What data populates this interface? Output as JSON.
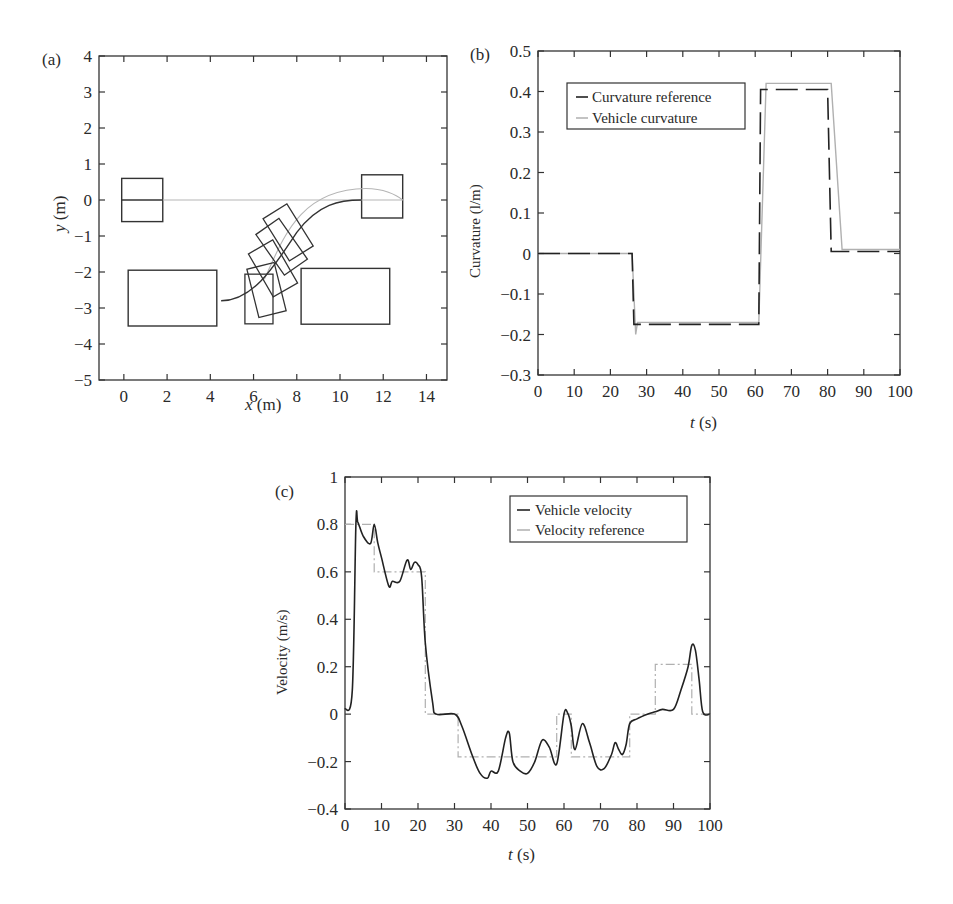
{
  "panels": {
    "a": {
      "label": "(a)",
      "xlabel_var": "x",
      "xlabel_unit": " (m)",
      "ylabel_var": "y",
      "ylabel_unit": " (m)"
    },
    "b": {
      "label": "(b)",
      "xlabel_var": "t",
      "xlabel_unit": " (s)",
      "ylabel": "Curvature (l/m)",
      "legend": [
        "Curvature reference",
        "Vehicle curvature"
      ]
    },
    "c": {
      "label": "(c)",
      "xlabel_var": "t",
      "xlabel_unit": " (s)",
      "ylabel": "Velocity (m/s)",
      "legend": [
        "Vehicle velocity",
        "Velocity reference"
      ]
    }
  },
  "chart_data": [
    {
      "type": "line",
      "panel": "(a)",
      "title": "",
      "xlabel": "x (m)",
      "ylabel": "y (m)",
      "xlim": [
        -1,
        15
      ],
      "ylim": [
        -5,
        4
      ],
      "xticks": [
        0,
        2,
        4,
        6,
        8,
        10,
        12,
        14
      ],
      "yticks": [
        4,
        3,
        2,
        1,
        0,
        -1,
        -2,
        -3,
        -4,
        -5
      ],
      "series": [
        {
          "name": "reference path",
          "color": "#aaaaaa",
          "x": [
            0,
            8,
            10,
            11,
            12,
            13
          ],
          "y": [
            0,
            0,
            0.2,
            0.3,
            0.25,
            0
          ]
        },
        {
          "name": "vehicle path",
          "color": "#222222",
          "x": [
            0,
            1.8
          ],
          "y": [
            0,
            0
          ]
        },
        {
          "name": "vehicle path (parking)",
          "color": "#222222",
          "x": [
            4.5,
            5.5,
            6.5,
            7.5,
            8.5,
            9.5,
            10.5,
            11
          ],
          "y": [
            -2.8,
            -2.6,
            -2.1,
            -1.4,
            -0.7,
            -0.25,
            0,
            0
          ]
        }
      ],
      "obstacles": [
        {
          "name": "start box",
          "x0": -0.1,
          "y0": -0.6,
          "x1": 1.8,
          "y1": 0.6
        },
        {
          "name": "goal box",
          "x0": 11,
          "y0": -0.5,
          "x1": 12.9,
          "y1": 0.7
        },
        {
          "name": "parked car left",
          "x0": 0.2,
          "y0": -3.5,
          "x1": 4.3,
          "y1": -1.95
        },
        {
          "name": "parked car right",
          "x0": 8.2,
          "y0": -3.45,
          "x1": 12.3,
          "y1": -1.9
        }
      ]
    },
    {
      "type": "line",
      "panel": "(b)",
      "title": "",
      "xlabel": "t (s)",
      "ylabel": "Curvature (l/m)",
      "xlim": [
        0,
        100
      ],
      "ylim": [
        -0.3,
        0.5
      ],
      "xticks": [
        0,
        10,
        20,
        30,
        40,
        50,
        60,
        70,
        80,
        90,
        100
      ],
      "yticks": [
        0.5,
        0.4,
        0.3,
        0.2,
        0.1,
        0,
        -0.1,
        -0.2,
        -0.3
      ],
      "legend_position": "upper left",
      "series": [
        {
          "name": "Curvature reference",
          "style": "dashed",
          "color": "#222222",
          "x": [
            0,
            26,
            26.5,
            61,
            61.5,
            80,
            81,
            100
          ],
          "y": [
            0,
            0,
            -0.175,
            -0.175,
            0.405,
            0.405,
            0.005,
            0.005
          ]
        },
        {
          "name": "Vehicle curvature",
          "style": "solid",
          "color": "#aaaaaa",
          "x": [
            0,
            26,
            27,
            27.5,
            61,
            63,
            81,
            84,
            100
          ],
          "y": [
            0,
            0,
            -0.2,
            -0.17,
            -0.17,
            0.42,
            0.42,
            0.01,
            0.01
          ]
        }
      ]
    },
    {
      "type": "line",
      "panel": "(c)",
      "title": "",
      "xlabel": "t (s)",
      "ylabel": "Velocity (m/s)",
      "xlim": [
        0,
        100
      ],
      "ylim": [
        -0.4,
        1
      ],
      "xticks": [
        0,
        10,
        20,
        30,
        40,
        50,
        60,
        70,
        80,
        90,
        100
      ],
      "yticks": [
        1,
        0.8,
        0.6,
        0.4,
        0.2,
        0,
        -0.2,
        -0.4
      ],
      "legend_position": "upper right",
      "series": [
        {
          "name": "Vehicle velocity",
          "style": "solid",
          "color": "#222222",
          "x": [
            0,
            2,
            3,
            3.5,
            5,
            7,
            8,
            9,
            10,
            12,
            13,
            15,
            17,
            18,
            19,
            20,
            21,
            22,
            24,
            25,
            30,
            32,
            35,
            37,
            39,
            40,
            42,
            44,
            45,
            46,
            48,
            50,
            52,
            54,
            56,
            58,
            60,
            61,
            62,
            63,
            65,
            67,
            69,
            71,
            73,
            74,
            75,
            76,
            77,
            78,
            80,
            83,
            85,
            87,
            90,
            92,
            94,
            95,
            96,
            97,
            98,
            100
          ],
          "y": [
            0.02,
            0.1,
            0.8,
            0.81,
            0.75,
            0.72,
            0.8,
            0.72,
            0.66,
            0.54,
            0.56,
            0.56,
            0.65,
            0.61,
            0.64,
            0.63,
            0.58,
            0.3,
            0.05,
            0,
            0,
            -0.05,
            -0.18,
            -0.25,
            -0.27,
            -0.24,
            -0.24,
            -0.1,
            -0.08,
            -0.2,
            -0.24,
            -0.25,
            -0.2,
            -0.11,
            -0.14,
            -0.21,
            0,
            0.005,
            -0.05,
            -0.15,
            -0.04,
            -0.12,
            -0.22,
            -0.23,
            -0.17,
            -0.12,
            -0.15,
            -0.17,
            -0.13,
            -0.04,
            -0.02,
            0,
            0.01,
            0.02,
            0.02,
            0.1,
            0.2,
            0.29,
            0.27,
            0.15,
            0.01,
            0
          ]
        },
        {
          "name": "Velocity reference",
          "style": "dash-dot",
          "color": "#aaaaaa",
          "x": [
            0,
            8,
            8,
            22,
            22,
            31,
            31,
            58,
            58,
            62,
            62,
            78,
            78,
            85,
            85,
            95,
            95,
            100
          ],
          "y": [
            0.8,
            0.8,
            0.6,
            0.6,
            0,
            0,
            -0.18,
            -0.18,
            0,
            0,
            -0.18,
            -0.18,
            0,
            0,
            0.21,
            0.21,
            0,
            0
          ]
        }
      ]
    }
  ]
}
